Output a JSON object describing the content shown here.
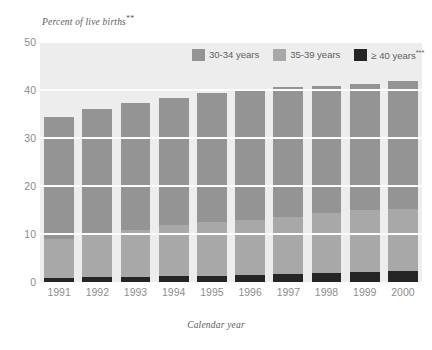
{
  "chart_data": {
    "type": "bar",
    "title": "",
    "subtitle": "",
    "ylabel": "Percent of live births",
    "ylabel_footnote": "**",
    "xlabel": "Calendar year",
    "ylim": [
      0,
      50
    ],
    "yticks": [
      0,
      10,
      20,
      30,
      40,
      50
    ],
    "grid": true,
    "stacked": true,
    "legend_position": "top-right",
    "categories": [
      "1991",
      "1992",
      "1993",
      "1994",
      "1995",
      "1996",
      "1997",
      "1998",
      "1999",
      "2000"
    ],
    "series": [
      {
        "name": "30-34 years",
        "color": "#949494",
        "values": [
          25.5,
          26.2,
          26.3,
          26.5,
          26.9,
          27.2,
          27.1,
          26.6,
          26.3,
          26.5
        ]
      },
      {
        "name": "35-39 years",
        "color": "#a8a8a8",
        "values": [
          8.0,
          8.9,
          9.8,
          10.6,
          11.2,
          11.6,
          12.0,
          12.5,
          13.0,
          13.1
        ]
      },
      {
        "name": "≥ 40 years",
        "footnote": "***",
        "color": "#252525",
        "values": [
          0.9,
          1.0,
          1.1,
          1.2,
          1.3,
          1.4,
          1.6,
          1.8,
          2.0,
          2.2
        ]
      }
    ],
    "totals": [
      34.4,
      36.1,
      37.2,
      38.3,
      39.4,
      40.2,
      40.7,
      40.9,
      41.3,
      41.8
    ]
  },
  "legend": {
    "items": [
      {
        "label": "30-34 years",
        "footnote": "",
        "color": "#949494"
      },
      {
        "label": "35-39 years",
        "footnote": "",
        "color": "#a8a8a8"
      },
      {
        "label": "≥ 40 years",
        "footnote": "***",
        "color": "#252525"
      }
    ]
  },
  "style": {
    "plot_background": "#ededed",
    "gridline_color": "#fdfdfd",
    "tick_label_color": "#8a8a8a",
    "axis_title_color": "#5a5a5a",
    "page_background": "#ffffff"
  }
}
